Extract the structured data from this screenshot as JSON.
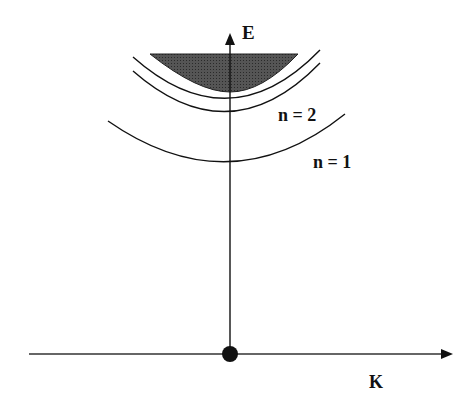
{
  "diagram": {
    "type": "dispersion-diagram",
    "axes": {
      "vertical_label": "E",
      "horizontal_label": "K",
      "origin_marker": "filled-circle"
    },
    "bands": [
      {
        "label": "n = 1",
        "description": "lowest parabolic band"
      },
      {
        "label": "n = 2",
        "description": "second parabolic band"
      },
      {
        "label": "",
        "description": "third parabolic band (unlabeled)"
      },
      {
        "label": "",
        "description": "shaded continuum region"
      }
    ],
    "colors": {
      "line": "#111111",
      "shade": "#4a4a4a",
      "background": "#ffffff"
    }
  }
}
